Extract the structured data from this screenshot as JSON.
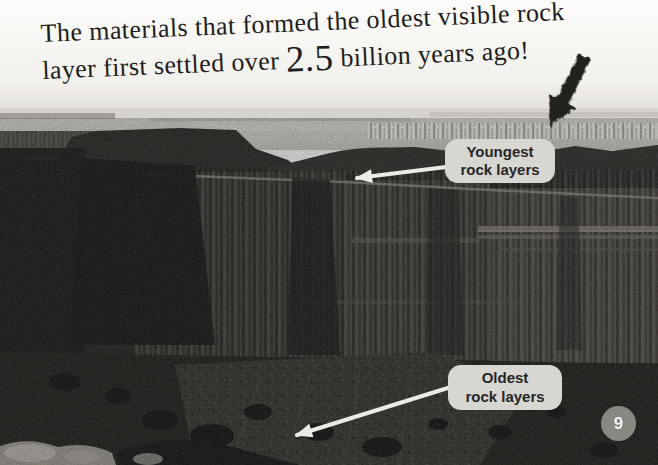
{
  "caption": {
    "line1": "The materials that formed the oldest visible rock",
    "line2_prefix": "layer first settled over ",
    "line2_number": "2.5",
    "line2_suffix": " billion years ago!"
  },
  "labels": {
    "youngest": {
      "line1": "Youngest",
      "line2": "rock layers"
    },
    "oldest": {
      "line1": "Oldest",
      "line2": "rock layers"
    }
  },
  "page_number": "9",
  "icons": {
    "grunge_arrow": "distressed-down-left-arrow",
    "youngest_pointer": "thin-arrow-to-canyon-rim",
    "oldest_pointer": "thin-arrow-to-inner-gorge"
  },
  "colors": {
    "caption_text": "#1d1d1d",
    "label_bg": "#d8d6d1",
    "label_text": "#262626",
    "pointer_arrow": "#eceae4",
    "grunge_arrow": "#24211c",
    "badge_bg": "#8f8d86",
    "badge_text": "#ffffff"
  }
}
